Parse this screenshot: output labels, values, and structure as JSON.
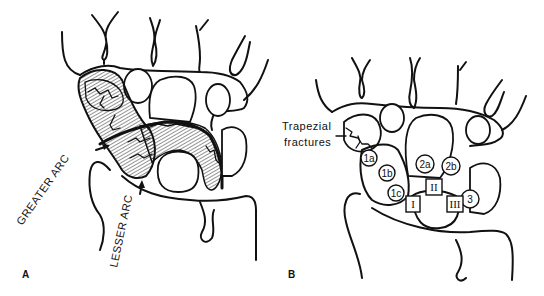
{
  "figure": {
    "panels": [
      {
        "id": "A",
        "label": "A",
        "annotations": [
          {
            "text": "GREATER ARC",
            "role": "arrow-label"
          },
          {
            "text": "LESSER ARC",
            "role": "arrow-label"
          }
        ]
      },
      {
        "id": "B",
        "label": "B",
        "callout": {
          "line1": "Trapezial",
          "line2": "fractures"
        },
        "circle_markers": [
          "1a",
          "1b",
          "1c",
          "2a",
          "2b",
          "3"
        ],
        "box_markers": [
          "I",
          "II",
          "III"
        ]
      }
    ],
    "colors": {
      "line": "#111111",
      "background": "#ffffff"
    }
  }
}
